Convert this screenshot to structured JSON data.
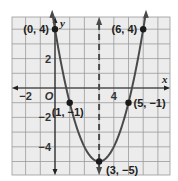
{
  "chart_data": {
    "type": "line",
    "title": "",
    "function": "y = (x - 3)^2 - 5",
    "xlabel": "x",
    "ylabel": "y",
    "xlim": [
      -3,
      7.8
    ],
    "ylim": [
      -6.2,
      4.6
    ],
    "grid": true,
    "x_ticks": [
      {
        "value": -2,
        "label": "−2"
      },
      {
        "value": 0,
        "label": "O"
      },
      {
        "value": 4,
        "label": "4"
      }
    ],
    "y_ticks": [
      {
        "value": 2,
        "label": "2"
      },
      {
        "value": -2,
        "label": "−2"
      },
      {
        "value": -4,
        "label": "−4"
      }
    ],
    "series": [
      {
        "name": "parabola",
        "style": "solid",
        "color": "#4a4a4a",
        "x": [
          -0.15,
          0,
          1,
          2,
          3,
          4,
          5,
          6,
          6.15
        ],
        "y": [
          4.92,
          4,
          -1,
          -4,
          -5,
          -4,
          -1,
          4,
          4.92
        ]
      },
      {
        "name": "axis of symmetry",
        "style": "dashed",
        "color": "#4a4a4a",
        "equation": "x = 3"
      }
    ],
    "points": [
      {
        "x": 0,
        "y": 4,
        "label": "(0, 4)"
      },
      {
        "x": 6,
        "y": 4,
        "label": "(6, 4)"
      },
      {
        "x": 1,
        "y": -1,
        "label": "(1, −1)"
      },
      {
        "x": 5,
        "y": -1,
        "label": "(5, −1)"
      },
      {
        "x": 3,
        "y": -5,
        "label": "(3, −5)"
      }
    ]
  },
  "colors": {
    "grid_bg": "#ececec",
    "grid_line": "#9a9a9a",
    "curve": "#4a4a4a",
    "text": "#222222"
  }
}
